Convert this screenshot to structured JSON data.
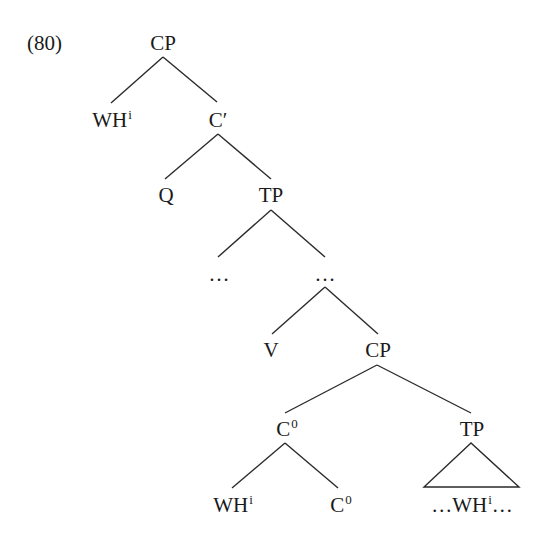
{
  "example_number": "(80)",
  "tree": {
    "root": {
      "label": "CP"
    },
    "spec_wh": {
      "label": "WH",
      "index": "i"
    },
    "c_bar": {
      "label": "C′"
    },
    "q": {
      "label": "Q"
    },
    "tp1": {
      "label": "TP"
    },
    "dots_left": {
      "label": "…"
    },
    "dots_right": {
      "label": "…"
    },
    "v": {
      "label": "V"
    },
    "cp2": {
      "label": "CP"
    },
    "c0_upper": {
      "label": "C",
      "superscript": "0"
    },
    "tp2": {
      "label": "TP"
    },
    "wh_lower": {
      "label": "WH",
      "index": "i"
    },
    "c0_lower": {
      "label": "C",
      "superscript": "0"
    },
    "tp2_content": {
      "prefix": "…WH",
      "index": "i",
      "suffix": "…"
    }
  }
}
